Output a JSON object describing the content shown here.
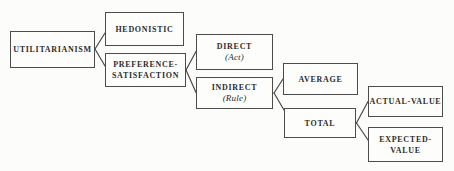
{
  "diagram": {
    "background_color": "#fcfcfb",
    "line_color": "#4a4a4a",
    "text_color": "#2d2d2d",
    "nodes": [
      {
        "id": "utilitarianism",
        "label": "UTILITARIANISM"
      },
      {
        "id": "hedonistic",
        "label": "HEDONISTIC"
      },
      {
        "id": "preference-satisfaction",
        "label": "PREFERENCE-",
        "label2": "SATISFACTION"
      },
      {
        "id": "direct",
        "label": "DIRECT",
        "sublabel": "(Act)"
      },
      {
        "id": "indirect",
        "label": "INDIRECT",
        "sublabel": "(Rule)"
      },
      {
        "id": "average",
        "label": "AVERAGE"
      },
      {
        "id": "total",
        "label": "TOTAL"
      },
      {
        "id": "actual-value",
        "label": "ACTUAL-VALUE"
      },
      {
        "id": "expected-value",
        "label": "EXPECTED-",
        "label2": "VALUE"
      }
    ],
    "edges": [
      {
        "from": "utilitarianism",
        "to": "hedonistic"
      },
      {
        "from": "utilitarianism",
        "to": "preference-satisfaction"
      },
      {
        "from": "preference-satisfaction",
        "to": "direct"
      },
      {
        "from": "preference-satisfaction",
        "to": "indirect"
      },
      {
        "from": "indirect",
        "to": "average"
      },
      {
        "from": "indirect",
        "to": "total"
      },
      {
        "from": "total",
        "to": "actual-value"
      },
      {
        "from": "total",
        "to": "expected-value"
      }
    ]
  }
}
